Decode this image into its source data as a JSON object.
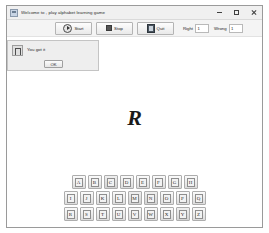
{
  "window": {
    "title": "Welcome to , play alphabet learning game",
    "icon": "app-window-icon",
    "controls": {
      "minimize": "minimize-icon",
      "maximize": "maximize-icon",
      "close": "close-icon"
    }
  },
  "toolbar": {
    "start_label": "Start",
    "start_icon": "play-icon",
    "stop_label": "Stop",
    "stop_icon": "stop-square-icon",
    "quit_label": "Quit",
    "quit_icon": "door-exit-icon",
    "right_label": "Right",
    "right_value": "1",
    "wrong_label": "Wrong",
    "wrong_value": "1"
  },
  "dialog": {
    "icon": "info-icon",
    "message": "You got it",
    "ok_label": "OK"
  },
  "prompt": {
    "letter": "R"
  },
  "keyboard": {
    "rows": [
      [
        "A",
        "B",
        "C",
        "D",
        "E",
        "F",
        "G",
        "H"
      ],
      [
        "I",
        "J",
        "K",
        "L",
        "M",
        "N",
        "O",
        "P",
        "Q"
      ],
      [
        "R",
        "S",
        "T",
        "U",
        "V",
        "W",
        "X",
        "Y",
        "Z"
      ]
    ]
  },
  "colors": {
    "window_bg": "#ffffff",
    "chrome": "#f0f0f0",
    "toolbar": "#f4f4f4",
    "border": "#9a9a9a",
    "dialog_bg": "#eeeeee",
    "text": "#1f1f1f"
  }
}
